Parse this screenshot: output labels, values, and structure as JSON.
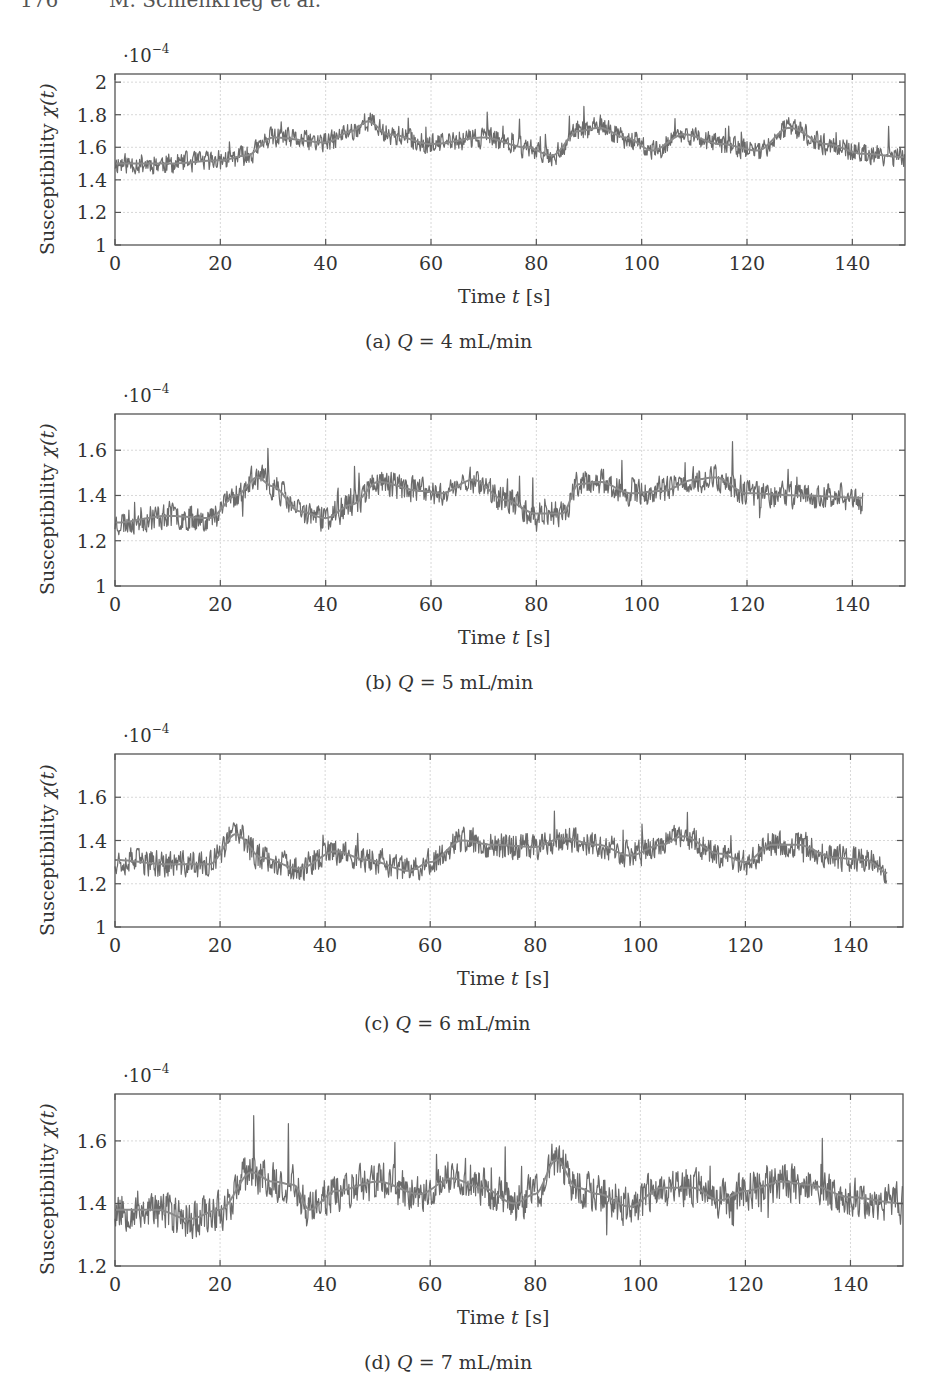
{
  "page": {
    "running_header": "176        M. Schlenkrieg et al."
  },
  "chart_data": [
    {
      "type": "line",
      "id": "a",
      "caption_prefix": "(a)",
      "caption_var": "Q",
      "caption_value": "= 4 mL/min",
      "title": "",
      "xlabel": "Time t [s]",
      "xlabel_text": "Time ",
      "xlabel_var": "t",
      "xlabel_unit": "[s]",
      "ylabel": "Susceptibility χ(t)",
      "y_multiplier": "·10",
      "y_multiplier_exp": "−4",
      "xlim": [
        0,
        150
      ],
      "ylim": [
        1,
        2.05
      ],
      "xticks": [
        0,
        20,
        40,
        60,
        80,
        100,
        120,
        140
      ],
      "yticks": [
        1,
        1.2,
        1.4,
        1.6,
        1.8,
        2
      ],
      "ytick_labels": [
        "1",
        "1.2",
        "1.4",
        "1.6",
        "1.8",
        "2"
      ],
      "grid": true,
      "x_end": 150,
      "noise": 0.075,
      "seed": 11,
      "series": [
        {
          "name": "χ(t) raw",
          "trend": {
            "x": [
              0,
              10,
              20,
              25,
              30,
              40,
              45,
              48,
              52,
              60,
              70,
              78,
              83,
              88,
              92,
              97,
              102,
              108,
              115,
              122,
              128,
              135,
              142,
              150
            ],
            "y": [
              1.5,
              1.5,
              1.52,
              1.55,
              1.66,
              1.63,
              1.7,
              1.76,
              1.68,
              1.62,
              1.66,
              1.6,
              1.55,
              1.7,
              1.72,
              1.66,
              1.58,
              1.68,
              1.62,
              1.58,
              1.72,
              1.62,
              1.56,
              1.54
            ]
          }
        },
        {
          "name": "χ(t) moving average"
        }
      ]
    },
    {
      "type": "line",
      "id": "b",
      "caption_prefix": "(b)",
      "caption_var": "Q",
      "caption_value": "= 5 mL/min",
      "title": "",
      "xlabel": "Time t [s]",
      "xlabel_text": "Time ",
      "xlabel_var": "t",
      "xlabel_unit": "[s]",
      "ylabel": "Susceptibility χ(t)",
      "y_multiplier": "·10",
      "y_multiplier_exp": "−4",
      "xlim": [
        0,
        150
      ],
      "ylim": [
        1,
        1.76
      ],
      "xticks": [
        0,
        20,
        40,
        60,
        80,
        100,
        120,
        140
      ],
      "yticks": [
        1,
        1.2,
        1.4,
        1.6
      ],
      "ytick_labels": [
        "1",
        "1.2",
        "1.4",
        "1.6"
      ],
      "grid": true,
      "x_end": 142,
      "noise": 0.07,
      "seed": 23,
      "series": [
        {
          "name": "χ(t) raw",
          "trend": {
            "x": [
              0,
              10,
              18,
              23,
              27,
              30,
              35,
              40,
              45,
              50,
              58,
              62,
              68,
              74,
              80,
              85,
              88,
              92,
              98,
              104,
              110,
              114,
              120,
              130,
              142
            ],
            "y": [
              1.28,
              1.31,
              1.3,
              1.4,
              1.48,
              1.44,
              1.33,
              1.3,
              1.36,
              1.46,
              1.42,
              1.41,
              1.47,
              1.38,
              1.32,
              1.32,
              1.45,
              1.46,
              1.41,
              1.42,
              1.47,
              1.48,
              1.41,
              1.4,
              1.39
            ]
          }
        },
        {
          "name": "χ(t) moving average"
        }
      ]
    },
    {
      "type": "line",
      "id": "c",
      "caption_prefix": "(c)",
      "caption_var": "Q",
      "caption_value": "= 6 mL/min",
      "title": "",
      "xlabel": "Time t [s]",
      "xlabel_text": "Time ",
      "xlabel_var": "t",
      "xlabel_unit": "[s]",
      "ylabel": "Susceptibility χ(t)",
      "y_multiplier": "·10",
      "y_multiplier_exp": "−4",
      "xlim": [
        0,
        150
      ],
      "ylim": [
        1,
        1.8
      ],
      "xticks": [
        0,
        20,
        40,
        60,
        80,
        100,
        120,
        140
      ],
      "yticks": [
        1,
        1.2,
        1.4,
        1.6
      ],
      "ytick_labels": [
        "1",
        "1.2",
        "1.4",
        "1.6"
      ],
      "grid": true,
      "x_end": 147,
      "noise": 0.075,
      "seed": 37,
      "series": [
        {
          "name": "χ(t) raw",
          "trend": {
            "x": [
              0,
              10,
              18,
              23,
              28,
              35,
              42,
              48,
              56,
              60,
              66,
              72,
              80,
              85,
              92,
              98,
              104,
              108,
              115,
              120,
              125,
              130,
              137,
              143,
              147
            ],
            "y": [
              1.31,
              1.29,
              1.29,
              1.43,
              1.32,
              1.27,
              1.35,
              1.31,
              1.26,
              1.3,
              1.4,
              1.38,
              1.37,
              1.41,
              1.38,
              1.33,
              1.38,
              1.42,
              1.34,
              1.3,
              1.38,
              1.38,
              1.32,
              1.31,
              1.25
            ]
          }
        },
        {
          "name": "χ(t) moving average"
        }
      ]
    },
    {
      "type": "line",
      "id": "d",
      "caption_prefix": "(d)",
      "caption_var": "Q",
      "caption_value": "= 7 mL/min",
      "title": "",
      "xlabel": "Time t [s]",
      "xlabel_text": "Time ",
      "xlabel_var": "t",
      "xlabel_unit": "[s]",
      "ylabel": "Susceptibility χ(t)",
      "y_multiplier": "·10",
      "y_multiplier_exp": "−4",
      "xlim": [
        0,
        150
      ],
      "ylim": [
        1.2,
        1.75
      ],
      "xticks": [
        0,
        20,
        40,
        60,
        80,
        100,
        120,
        140
      ],
      "yticks": [
        1.2,
        1.4,
        1.6
      ],
      "ytick_labels": [
        "1.2",
        "1.4",
        "1.6"
      ],
      "grid": true,
      "x_end": 150,
      "noise": 0.075,
      "seed": 53,
      "series": [
        {
          "name": "χ(t) raw",
          "trend": {
            "x": [
              0,
              8,
              14,
              20,
              26,
              30,
              34,
              37,
              42,
              50,
              58,
              64,
              70,
              76,
              80,
              84,
              88,
              92,
              98,
              104,
              110,
              115,
              120,
              127,
              132,
              140,
              150
            ],
            "y": [
              1.38,
              1.38,
              1.35,
              1.38,
              1.5,
              1.47,
              1.46,
              1.38,
              1.44,
              1.47,
              1.43,
              1.48,
              1.45,
              1.4,
              1.43,
              1.54,
              1.45,
              1.43,
              1.39,
              1.45,
              1.45,
              1.41,
              1.44,
              1.47,
              1.46,
              1.42,
              1.4
            ]
          }
        },
        {
          "name": "χ(t) moving average"
        }
      ]
    }
  ],
  "layout": {
    "panels": [
      {
        "top": 74,
        "bottom": 245,
        "left": 115,
        "right": 905
      },
      {
        "top": 414,
        "bottom": 586,
        "left": 115,
        "right": 905
      },
      {
        "top": 754,
        "bottom": 927,
        "left": 115,
        "right": 903
      },
      {
        "top": 1094,
        "bottom": 1266,
        "left": 115,
        "right": 903
      }
    ],
    "line_color": "#6b6b6b",
    "trend_color": "#8a8a8a",
    "axis_color": "#555555",
    "grid_color": "#d8d8d8"
  }
}
